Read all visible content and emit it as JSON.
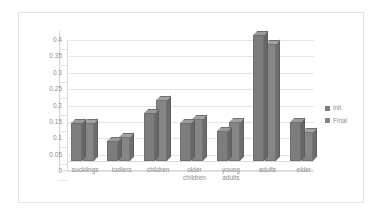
{
  "chart_data": {
    "type": "bar",
    "title": "",
    "subtitle": "",
    "xlabel": "",
    "ylabel": "",
    "ylim": [
      0,
      0.4
    ],
    "yticks": [
      0,
      0.05,
      0.1,
      0.15,
      0.2,
      0.25,
      0.3,
      0.35,
      0.4
    ],
    "ytick_labels": [
      "0",
      "0.05",
      "0.1",
      "0.15",
      "0.2",
      "0.25",
      "0.3",
      "0.35",
      "0.4"
    ],
    "grid": true,
    "legend_position": "right",
    "style": "3d-clustered-column",
    "categories": [
      "sucklings",
      "todlers",
      "children",
      "older children",
      "young adults",
      "adults",
      "elder"
    ],
    "category_lines": [
      [
        "sucklings"
      ],
      [
        "todlers"
      ],
      [
        "children"
      ],
      [
        "older",
        "children"
      ],
      [
        "young",
        "adults"
      ],
      [
        "adults"
      ],
      [
        "elder"
      ]
    ],
    "series": [
      {
        "name": "init",
        "color": "#7d7d7d",
        "values": [
          0.117,
          0.06,
          0.147,
          0.117,
          0.093,
          0.385,
          0.118
        ]
      },
      {
        "name": "Final",
        "color": "#868686",
        "values": [
          0.117,
          0.072,
          0.185,
          0.128,
          0.118,
          0.358,
          0.088
        ]
      }
    ]
  },
  "legend": {
    "items": [
      {
        "label": "init"
      },
      {
        "label": "Final"
      }
    ]
  }
}
